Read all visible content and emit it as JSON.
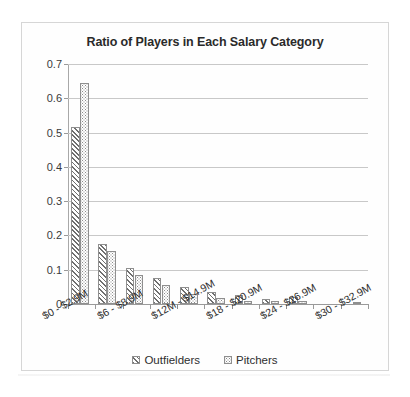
{
  "chart_data": {
    "type": "bar",
    "title": "Ratio of Players in Each Salary Category",
    "xlabel": "",
    "ylabel": "",
    "ylim": [
      0,
      0.7
    ],
    "ytick_labels": [
      "0.7",
      "0.6",
      "0.5",
      "0.4",
      "0.3",
      "0.2",
      "0.1",
      "0"
    ],
    "ytick_values": [
      0.7,
      0.6,
      0.5,
      0.4,
      0.3,
      0.2,
      0.1,
      0
    ],
    "grid": true,
    "legend_position": "bottom",
    "categories": [
      "$0 - $2.9M",
      "$3 - $5.9M",
      "$6 - $8.9M",
      "$9M - $11.9M",
      "$12M - $14.9M",
      "$15 - $17.9M",
      "$18 - $20.9M",
      "$21 - $23.9M",
      "$24 - $26.9M",
      "$27 - $29.9M",
      "$30 - $32.9M"
    ],
    "visible_tick_labels": [
      "$0 - $2.9M",
      "$6 - $8.9M",
      "$12M - $14.9M",
      "$18 - $20.9M",
      "$24 - $26.9M",
      "$30 - $32.9M"
    ],
    "visible_tick_indices": [
      0,
      2,
      4,
      6,
      8,
      10
    ],
    "series": [
      {
        "name": "Outfielders",
        "pattern": "diagonal-hatch",
        "color": "#6f6f6f",
        "values": [
          0.515,
          0.175,
          0.105,
          0.075,
          0.05,
          0.035,
          0.025,
          0.015,
          0.02,
          0.0,
          0.0
        ]
      },
      {
        "name": "Pitchers",
        "pattern": "dotted",
        "color": "#8b8b8b",
        "values": [
          0.645,
          0.155,
          0.085,
          0.055,
          0.03,
          0.018,
          0.01,
          0.008,
          0.008,
          0.0,
          0.004
        ]
      }
    ]
  },
  "legend": {
    "items": [
      {
        "label": "Outfielders",
        "swatch": "diagonal-hatch-swatch"
      },
      {
        "label": "Pitchers",
        "swatch": "dotted-swatch"
      }
    ]
  }
}
